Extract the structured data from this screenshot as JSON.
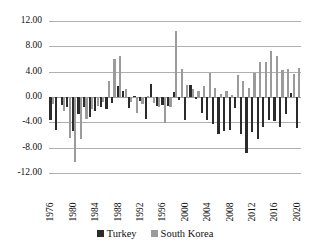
{
  "chart_data": {
    "type": "bar",
    "title": "",
    "subtitle": "",
    "xlabel": "",
    "ylabel": "",
    "ylim": [
      -12,
      12
    ],
    "ytick_values": [
      12,
      8,
      4,
      0,
      -4,
      -8,
      -12
    ],
    "ytick_labels": [
      "12.00",
      "8.00",
      "4.00",
      "0.00",
      "-4.00",
      "-8.00",
      "-12.00"
    ],
    "grid": true,
    "legend_position": "bottom",
    "x": [
      1976,
      1977,
      1978,
      1979,
      1980,
      1981,
      1982,
      1983,
      1984,
      1985,
      1986,
      1987,
      1988,
      1989,
      1990,
      1991,
      1992,
      1993,
      1994,
      1995,
      1996,
      1997,
      1998,
      1999,
      2000,
      2001,
      2002,
      2003,
      2004,
      2005,
      2006,
      2007,
      2008,
      2009,
      2010,
      2011,
      2012,
      2013,
      2014,
      2015,
      2016,
      2017,
      2018,
      2019,
      2020
    ],
    "xtick_labels": [
      "1976",
      "1980",
      "1984",
      "1988",
      "1992",
      "1996",
      "2000",
      "2004",
      "2008",
      "2012",
      "2016",
      "2020"
    ],
    "xtick_values": [
      1976,
      1980,
      1984,
      1988,
      1992,
      1996,
      2000,
      2004,
      2008,
      2012,
      2016,
      2020
    ],
    "categories": [
      "1976",
      "1977",
      "1978",
      "1979",
      "1980",
      "1981",
      "1982",
      "1983",
      "1984",
      "1985",
      "1986",
      "1987",
      "1988",
      "1989",
      "1990",
      "1991",
      "1992",
      "1993",
      "1994",
      "1995",
      "1996",
      "1997",
      "1998",
      "1999",
      "2000",
      "2001",
      "2002",
      "2003",
      "2004",
      "2005",
      "2006",
      "2007",
      "2008",
      "2009",
      "2010",
      "2011",
      "2012",
      "2013",
      "2014",
      "2015",
      "2016",
      "2017",
      "2018",
      "2019",
      "2020"
    ],
    "series": [
      {
        "name": "Turkey",
        "color": "#2b2b2b",
        "values": [
          -3.7,
          -5.2,
          -1.3,
          -1.5,
          -5.3,
          -2.7,
          -1.5,
          -3.1,
          -2.2,
          -1.5,
          -1.9,
          -0.9,
          1.8,
          0.9,
          -1.7,
          0.2,
          -0.6,
          -3.5,
          2.0,
          -1.4,
          -1.3,
          -1.4,
          0.8,
          -0.4,
          -3.7,
          1.9,
          -0.3,
          -2.5,
          -3.6,
          -4.3,
          -5.8,
          -5.4,
          -5.2,
          -1.8,
          -5.8,
          -8.9,
          -5.5,
          -6.7,
          -4.7,
          -3.7,
          -3.8,
          -4.8,
          -2.7,
          0.7,
          -4.9
        ]
      },
      {
        "name": "South Korea",
        "color": "#9b9b9b",
        "values": [
          -1.1,
          0.0,
          -2.2,
          -6.4,
          -10.2,
          -6.6,
          -3.4,
          -1.9,
          -1.4,
          -0.8,
          2.6,
          6.0,
          6.5,
          1.3,
          -0.8,
          -2.6,
          -1.1,
          0.2,
          -0.9,
          -1.6,
          -4.1,
          -1.5,
          10.4,
          4.4,
          1.9,
          1.2,
          0.9,
          1.7,
          3.8,
          1.4,
          0.4,
          1.0,
          0.3,
          3.5,
          2.6,
          1.5,
          3.8,
          5.6,
          5.6,
          7.2,
          6.5,
          4.2,
          4.5,
          3.6,
          4.6
        ]
      }
    ]
  },
  "legend": {
    "entries": [
      {
        "label": "Turkey",
        "swatch": "turkey-swatch"
      },
      {
        "label": "South Korea",
        "swatch": "south-korea-swatch"
      }
    ]
  }
}
